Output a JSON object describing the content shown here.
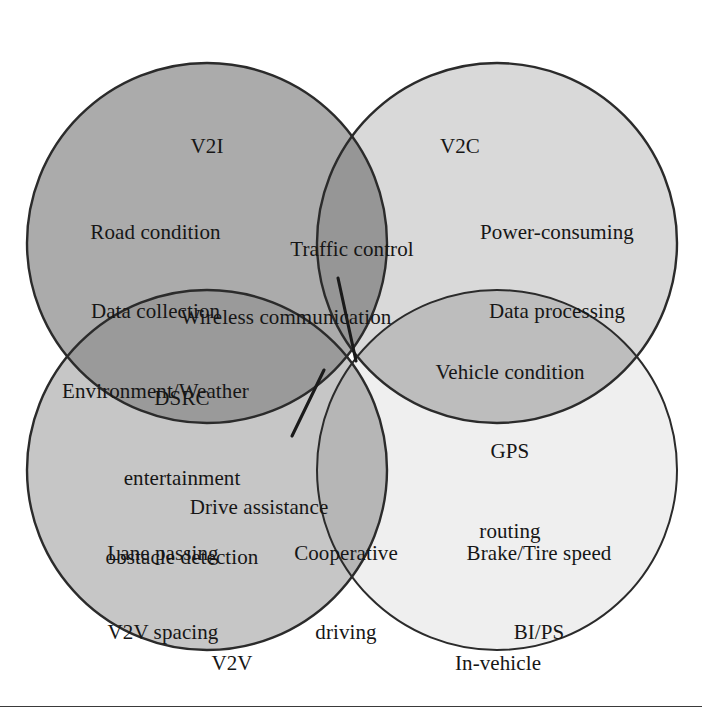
{
  "figure": {
    "type": "venn",
    "title": "",
    "circles": [
      {
        "id": "v2i",
        "title": "V2I",
        "fill": "#ababab",
        "stroke": "#2b2b2b",
        "cx": 207,
        "cy": 243,
        "r": 180,
        "items": [
          "Road condition",
          "Data collection",
          "Environment/Weather"
        ]
      },
      {
        "id": "v2c",
        "title": "V2C",
        "fill": "#d9d9d9",
        "stroke": "#2b2b2b",
        "cx": 497,
        "cy": 243,
        "r": 180,
        "items": [
          "Power-consuming",
          "Data processing"
        ]
      },
      {
        "id": "v2v",
        "title": "V2V",
        "fill": "#c6c6c6",
        "stroke": "#2b2b2b",
        "cx": 207,
        "cy": 470,
        "r": 180,
        "items": [
          "Lane passing",
          "V2V spacing"
        ]
      },
      {
        "id": "in-vehicle",
        "title": "In-vehicle",
        "fill": "#efefef",
        "stroke": "#2b2b2b",
        "cx": 497,
        "cy": 470,
        "r": 180,
        "items": [
          "Brake/Tire speed",
          "BI/PS"
        ]
      }
    ],
    "intersections": [
      {
        "id": "v2i-v2c",
        "label": "Traffic control",
        "between": [
          "V2I",
          "V2C"
        ]
      },
      {
        "id": "v2i-v2v",
        "label": "DSRC\nentertainment\nobstacle detection",
        "between": [
          "V2I",
          "V2V"
        ]
      },
      {
        "id": "v2c-invehicle",
        "label": "Vehicle condition\nGPS\nrouting",
        "between": [
          "V2C",
          "In-vehicle"
        ]
      },
      {
        "id": "v2v-invehicle",
        "label": "Cooperative\ndriving",
        "between": [
          "V2V",
          "In-vehicle"
        ]
      },
      {
        "id": "center-upper",
        "label": "Wireless communication",
        "between": [
          "V2I",
          "V2C",
          "V2V",
          "In-vehicle"
        ]
      },
      {
        "id": "center-lower",
        "label": "Drive assistance",
        "between": [
          "V2I",
          "V2C",
          "V2V",
          "In-vehicle"
        ]
      }
    ],
    "leader_lines": [
      {
        "id": "wireless-communication-leader",
        "x1": 338,
        "y1": 278,
        "x2": 356,
        "y2": 361
      },
      {
        "id": "drive-assistance-leader",
        "x1": 324,
        "y1": 370,
        "x2": 292,
        "y2": 436
      }
    ],
    "labels": {
      "v2i_title": "V2I",
      "v2c_title": "V2C",
      "v2v_title": "V2V",
      "invehicle_title": "In-vehicle",
      "v2i_items": "Road condition\nData collection\nEnvironment/Weather",
      "v2c_items": "Power-consuming\nData processing",
      "v2v_items": "Lane passing\nV2V spacing",
      "invehicle_items": "Brake/Tire speed\nBI/PS",
      "traffic_control": "Traffic control",
      "wireless_communication": "Wireless communication",
      "dsrc_block": "DSRC\nentertainment\nobstacle detection",
      "vehicle_condition_block": "Vehicle condition\nGPS\nrouting",
      "drive_assistance": "Drive assistance",
      "cooperative_driving": "Cooperative\ndriving"
    }
  }
}
